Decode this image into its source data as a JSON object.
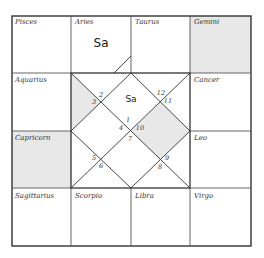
{
  "colors": {
    "line": "#333333",
    "shade": "#e8e8e8",
    "background": "#ffffff"
  },
  "south_chart": {
    "signs": [
      {
        "name": "Pisces",
        "row": 0,
        "col": 0,
        "shaded": false,
        "planets": ""
      },
      {
        "name": "Aries",
        "row": 0,
        "col": 1,
        "shaded": false,
        "planets": "Sa"
      },
      {
        "name": "Taurus",
        "row": 0,
        "col": 2,
        "shaded": false,
        "planets": ""
      },
      {
        "name": "Gemini",
        "row": 0,
        "col": 3,
        "shaded": true,
        "planets": ""
      },
      {
        "name": "Aquarius",
        "row": 1,
        "col": 0,
        "shaded": false,
        "planets": ""
      },
      {
        "name": "Cancer",
        "row": 1,
        "col": 3,
        "shaded": false,
        "planets": ""
      },
      {
        "name": "Capricorn",
        "row": 2,
        "col": 0,
        "shaded": true,
        "planets": ""
      },
      {
        "name": "Leo",
        "row": 2,
        "col": 3,
        "shaded": false,
        "planets": ""
      },
      {
        "name": "Sagittarius",
        "row": 3,
        "col": 0,
        "shaded": false,
        "planets": ""
      },
      {
        "name": "Scorpio",
        "row": 3,
        "col": 1,
        "shaded": false,
        "planets": ""
      },
      {
        "name": "Libra",
        "row": 3,
        "col": 2,
        "shaded": false,
        "planets": ""
      },
      {
        "name": "Virgo",
        "row": 3,
        "col": 3,
        "shaded": false,
        "planets": ""
      }
    ]
  },
  "north_chart": {
    "house_numbers": [
      {
        "label": "1",
        "x": 128,
        "y": 120
      },
      {
        "label": "2",
        "x": 101,
        "y": 95
      },
      {
        "label": "3",
        "x": 94,
        "y": 102
      },
      {
        "label": "4",
        "x": 121,
        "y": 128
      },
      {
        "label": "5",
        "x": 94,
        "y": 158
      },
      {
        "label": "6",
        "x": 101,
        "y": 166
      },
      {
        "label": "7",
        "x": 130,
        "y": 139
      },
      {
        "label": "8",
        "x": 160,
        "y": 167
      },
      {
        "label": "9",
        "x": 167,
        "y": 158
      },
      {
        "label": "10",
        "x": 140,
        "y": 128
      },
      {
        "label": "11",
        "x": 168,
        "y": 101
      },
      {
        "label": "12",
        "x": 161,
        "y": 93
      }
    ],
    "planets": [
      {
        "label": "Sa",
        "x": 131,
        "y": 99
      }
    ]
  }
}
